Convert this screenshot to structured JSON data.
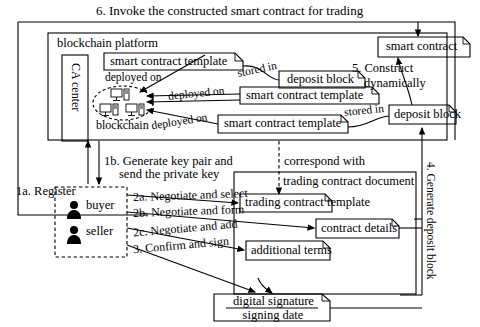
{
  "diagram": {
    "title_top": "6. Invoke the constructed smart contract for trading",
    "platform_label": "blockchain platform",
    "ca_center": "CA center",
    "blockchain_label": "blockchain",
    "nodes": [
      {
        "name": "smart contract template",
        "id": "sct-top"
      },
      {
        "name": "smart contract template",
        "id": "sct-mid"
      },
      {
        "name": "smart contract template",
        "id": "sct-bot"
      },
      {
        "name": "deposit block",
        "id": "deposit-top"
      },
      {
        "name": "deposit block",
        "id": "deposit-bot"
      },
      {
        "name": "smart contract",
        "id": "smart-contract"
      },
      {
        "name": "trading contract document",
        "id": "tcd"
      },
      {
        "name": "trading contract template",
        "id": "tct"
      },
      {
        "name": "contract details",
        "id": "details"
      },
      {
        "name": "additional terms",
        "id": "terms"
      },
      {
        "name": "digital signature",
        "id": "dsig"
      },
      {
        "name": "signing date",
        "id": "sdate"
      },
      {
        "name": "buyer",
        "id": "buyer"
      },
      {
        "name": "seller",
        "id": "seller"
      }
    ],
    "edge_labels": {
      "deployed_on_1": "deployed on",
      "deployed_on_2": "deployed on",
      "deployed_on_3": "deployed on",
      "stored_in_1": "stored in",
      "stored_in_2": "stored in",
      "construct": "5. Construct",
      "construct2": "dynamically",
      "generate_deposit": "4. Generate deposit block",
      "register": "1a. Register",
      "keypair_1": "1b. Generate key pair and",
      "keypair_2": "send the private key",
      "correspond": "correspond with",
      "step2a": "2a. Negotiate and select",
      "step2b": "2b. Negotiate and form",
      "step2c": "2c. Negotiate and add",
      "step3": "3. Confirm and sign"
    }
  }
}
